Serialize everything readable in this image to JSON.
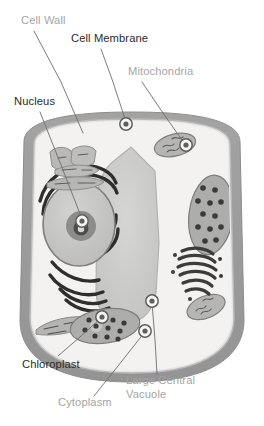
{
  "diagram": {
    "background_color": "#ffffff",
    "colors": {
      "cell_wall": "#9b9b9b",
      "cell_wall_outline": "#8a8a8a",
      "cytoplasm": "#f2f1ef",
      "vacuole_fill": "#c9c9c7",
      "vacuole_outline": "#b4b4b2",
      "nucleus_fill": "#c6c6c4",
      "nucleolus_fill": "#7b7b79",
      "organelle_fill": "#b0b0ae",
      "organelle_dark": "#4a4a48",
      "label_dark": "#2b2b2b",
      "label_gray": "#a5a5a5",
      "leader_line": "#6e6e6e",
      "marker_ring": "#5f5f5f"
    }
  },
  "labels": [
    {
      "id": "cell-wall",
      "text": "Cell Wall",
      "tone": "gray",
      "text_x": 21,
      "text_y": 24,
      "anchor": "start",
      "leader": [
        [
          34,
          31
        ],
        [
          61,
          82
        ],
        [
          83,
          133
        ]
      ],
      "marker": [
        83,
        133
      ],
      "marker_visible": false
    },
    {
      "id": "cell-membrane",
      "text": "Cell Membrane",
      "tone": "dark",
      "text_x": 71,
      "text_y": 42,
      "anchor": "start",
      "leader": [
        [
          101,
          49
        ],
        [
          113,
          82
        ],
        [
          126,
          122
        ]
      ],
      "marker": [
        126,
        124
      ],
      "marker_visible": true
    },
    {
      "id": "mitochondria",
      "text": "Mitochondria",
      "tone": "gray",
      "text_x": 128,
      "text_y": 75,
      "anchor": "start",
      "leader": [
        [
          142,
          82
        ],
        [
          163,
          113
        ],
        [
          184,
          143
        ]
      ],
      "marker": [
        186,
        145
      ],
      "marker_visible": true
    },
    {
      "id": "nucleus",
      "text": "Nucleus",
      "tone": "dark",
      "text_x": 14,
      "text_y": 105,
      "anchor": "start",
      "leader": [
        [
          40,
          112
        ],
        [
          61,
          165
        ],
        [
          82,
          219
        ]
      ],
      "marker": [
        82,
        221
      ],
      "marker_visible": true
    },
    {
      "id": "chloroplast",
      "text": "Chloroplast",
      "tone": "dark",
      "text_x": 22,
      "text_y": 368,
      "anchor": "start",
      "leader": [
        [
          58,
          356
        ],
        [
          80,
          337
        ],
        [
          101,
          318
        ]
      ],
      "marker": [
        102,
        317
      ],
      "marker_visible": true
    },
    {
      "id": "cytoplasm",
      "text": "Cytoplasm",
      "tone": "gray",
      "text_x": 58,
      "text_y": 406,
      "anchor": "start",
      "leader": [
        [
          94,
          396
        ],
        [
          118,
          366
        ],
        [
          144,
          333
        ]
      ],
      "marker": [
        145,
        331
      ],
      "marker_visible": true
    },
    {
      "id": "large-central-vacuole",
      "text": "Large Central",
      "text_line2": "Vacuole",
      "tone": "gray",
      "text_x": 126,
      "text_y": 384,
      "anchor": "start",
      "leader": [
        [
          157,
          374
        ],
        [
          155,
          340
        ],
        [
          152,
          303
        ]
      ],
      "marker": [
        152,
        301
      ],
      "marker_visible": true
    }
  ],
  "organelles": [
    {
      "id": "cell-wall-band",
      "name": "cell-wall"
    },
    {
      "id": "cell-membrane-band",
      "name": "cell-membrane"
    },
    {
      "id": "cytoplasm-area",
      "name": "cytoplasm"
    },
    {
      "id": "nucleus-body",
      "name": "nucleus"
    },
    {
      "id": "nucleolus-body",
      "name": "nucleolus"
    },
    {
      "id": "rough-er",
      "name": "rough-endoplasmic-reticulum"
    },
    {
      "id": "smooth-er",
      "name": "smooth-endoplasmic-reticulum"
    },
    {
      "id": "central-vacuole",
      "name": "large-central-vacuole"
    },
    {
      "id": "mitochondrion-top",
      "name": "mitochondrion"
    },
    {
      "id": "mitochondrion-right",
      "name": "mitochondrion"
    },
    {
      "id": "chloroplast-right",
      "name": "chloroplast"
    },
    {
      "id": "chloroplast-bottom",
      "name": "chloroplast"
    },
    {
      "id": "golgi-body",
      "name": "golgi-apparatus"
    }
  ]
}
